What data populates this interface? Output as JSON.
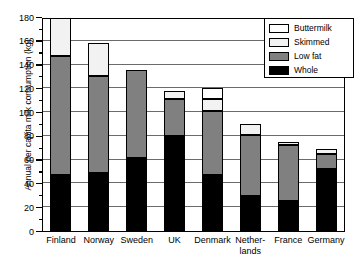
{
  "chart_data": {
    "type": "bar",
    "stacked": true,
    "title": "",
    "xlabel": "",
    "ylabel": "Annual per capita milk consumption (kg)",
    "ylim": [
      0,
      180
    ],
    "ytick_step": 20,
    "yminor_step": 10,
    "grid": true,
    "legend_position": "top-right",
    "categories": [
      "Finland",
      "Norway",
      "Sweden",
      "UK",
      "Denmark",
      "Nether-\nlands",
      "France",
      "Germany"
    ],
    "series": [
      {
        "name": "Whole",
        "color": "#000000",
        "values": [
          48,
          50,
          62,
          81,
          48,
          30,
          26,
          53
        ]
      },
      {
        "name": "Low fat",
        "color": "#808080",
        "values": [
          100,
          81,
          74,
          31,
          54,
          52,
          47,
          13
        ]
      },
      {
        "name": "Skimmed",
        "color": "#f2f2f2",
        "values": [
          32,
          28,
          0,
          7,
          10,
          9,
          3,
          4
        ]
      },
      {
        "name": "Buttermilk",
        "color": "#ffffff",
        "values": [
          0,
          0,
          0,
          0,
          9,
          0,
          0,
          0
        ]
      }
    ],
    "totals": [
      180,
      159,
      136,
      119,
      121,
      91,
      76,
      70
    ],
    "ytick_labels": [
      "0",
      "20",
      "40",
      "60",
      "80",
      "100",
      "120",
      "140",
      "160",
      "180"
    ]
  },
  "legend": {
    "items": [
      {
        "label": "Buttermilk",
        "color": "#ffffff"
      },
      {
        "label": "Skimmed",
        "color": "#f2f2f2"
      },
      {
        "label": "Low fat",
        "color": "#808080"
      },
      {
        "label": "Whole",
        "color": "#000000"
      }
    ]
  }
}
